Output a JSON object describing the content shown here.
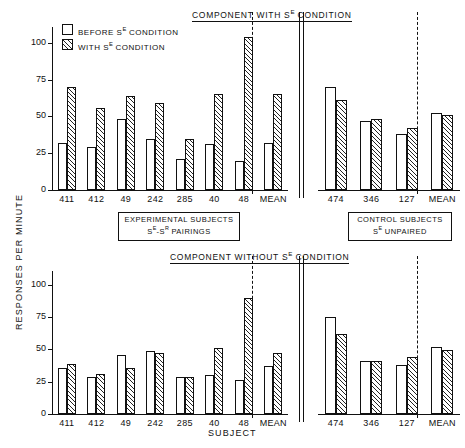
{
  "figure": {
    "ylabel": "RESPONSES PER MINUTE",
    "xlabel": "SUBJECT",
    "legend": [
      {
        "key": "before",
        "label": "BEFORE Sᴇ CONDITION",
        "style": "open"
      },
      {
        "key": "with",
        "label": "WITH Sᴇ CONDITION",
        "style": "hatched"
      }
    ],
    "legend_plain": [
      "BEFORE S",
      "CONDITION",
      "WITH S"
    ],
    "captions": [
      {
        "line1": "EXPERIMENTAL SUBJECTS",
        "line2": "Sᴇ-Sᴿ PAIRINGS"
      },
      {
        "line1": "CONTROL SUBJECTS",
        "line2": "Sᴇ UNPAIRED"
      }
    ]
  },
  "axis": {
    "yticks": [
      0,
      25,
      50,
      75,
      100
    ],
    "ytick_labels": [
      "0",
      "25",
      "50",
      "75",
      "100"
    ],
    "ylim": [
      0,
      110
    ],
    "grid": false
  },
  "chart_data": [
    {
      "id": "component-with-se",
      "type": "bar",
      "title": "COMPONENT WITH Sᴇ CONDITION",
      "title_plain": "COMPONENT WITH SE CONDITION",
      "xlabel": "SUBJECT",
      "ylabel": "RESPONSES PER MINUTE",
      "ylim": [
        0,
        110
      ],
      "yticks": [
        0,
        25,
        50,
        75,
        100
      ],
      "grid": false,
      "legend_position": "upper-left",
      "groups": [
        {
          "name": "EXPERIMENTAL SUBJECTS",
          "categories": [
            "411",
            "412",
            "49",
            "242",
            "285",
            "40",
            "48",
            "MEAN"
          ],
          "mean_index": 7,
          "series": [
            {
              "name": "BEFORE Sᴇ CONDITION",
              "values": [
                32,
                29,
                48,
                35,
                21,
                31,
                20,
                32
              ]
            },
            {
              "name": "WITH Sᴇ CONDITION",
              "values": [
                70,
                56,
                64,
                59,
                35,
                65,
                104,
                65
              ]
            }
          ]
        },
        {
          "name": "CONTROL SUBJECTS",
          "categories": [
            "474",
            "346",
            "127",
            "MEAN"
          ],
          "mean_index": 3,
          "series": [
            {
              "name": "BEFORE Sᴇ CONDITION",
              "values": [
                70,
                47,
                38,
                52
              ]
            },
            {
              "name": "WITH Sᴇ CONDITION",
              "values": [
                61,
                48,
                42,
                51
              ]
            }
          ]
        }
      ]
    },
    {
      "id": "component-without-se",
      "type": "bar",
      "title": "COMPONENT WITHOUT Sᴇ CONDITION",
      "title_plain": "COMPONENT WITHOUT SE CONDITION",
      "xlabel": "SUBJECT",
      "ylabel": "RESPONSES PER MINUTE",
      "ylim": [
        0,
        110
      ],
      "yticks": [
        0,
        25,
        50,
        75,
        100
      ],
      "grid": false,
      "legend_position": "none",
      "groups": [
        {
          "name": "EXPERIMENTAL SUBJECTS",
          "categories": [
            "411",
            "412",
            "49",
            "242",
            "285",
            "40",
            "48",
            "MEAN"
          ],
          "mean_index": 7,
          "series": [
            {
              "name": "BEFORE Sᴇ CONDITION",
              "values": [
                36,
                29,
                46,
                49,
                29,
                30,
                26,
                37
              ]
            },
            {
              "name": "WITH Sᴇ CONDITION",
              "values": [
                39,
                31,
                36,
                47,
                29,
                51,
                90,
                47
              ]
            }
          ]
        },
        {
          "name": "CONTROL SUBJECTS",
          "categories": [
            "474",
            "346",
            "127",
            "MEAN"
          ],
          "mean_index": 3,
          "series": [
            {
              "name": "BEFORE Sᴇ CONDITION",
              "values": [
                75,
                41,
                38,
                52
              ]
            },
            {
              "name": "WITH Sᴇ CONDITION",
              "values": [
                62,
                41,
                44,
                50
              ]
            }
          ]
        }
      ]
    }
  ]
}
